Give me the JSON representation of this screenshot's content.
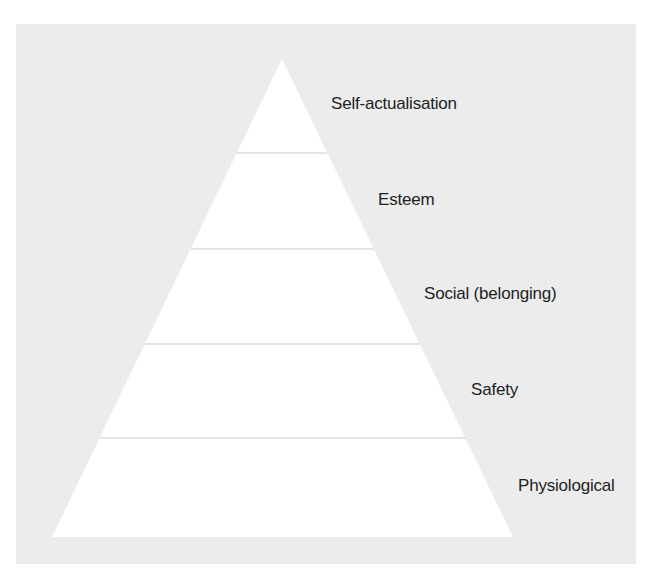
{
  "diagram": {
    "type": "pyramid",
    "title": "",
    "colors": {
      "background": "#ffffff",
      "panel": "#ececec",
      "pyramid_fill": "#ffffff",
      "divider": "#e4e4e4",
      "label_text": "#1e1e1e"
    },
    "levels": [
      {
        "order": 5,
        "label": "Self-actualisation"
      },
      {
        "order": 4,
        "label": "Esteem"
      },
      {
        "order": 3,
        "label": "Social (belonging)"
      },
      {
        "order": 2,
        "label": "Safety"
      },
      {
        "order": 1,
        "label": "Physiological"
      }
    ]
  }
}
